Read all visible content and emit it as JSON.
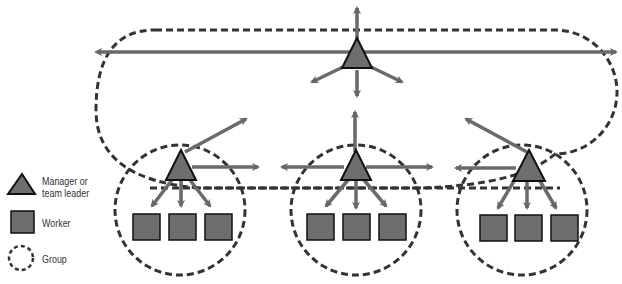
{
  "legend": {
    "manager": "Manager or",
    "manager_line2": "team leader",
    "worker": "Worker",
    "group": "Group"
  },
  "colors": {
    "fill": "#6e6e6e",
    "stroke": "#111111",
    "arrow": "#6a6a6a",
    "dash": "#333333"
  },
  "groups": [
    {
      "name": "top-group",
      "workers": 0
    },
    {
      "name": "left-group",
      "workers": 3
    },
    {
      "name": "center-group",
      "workers": 3
    },
    {
      "name": "right-group",
      "workers": 3
    }
  ]
}
